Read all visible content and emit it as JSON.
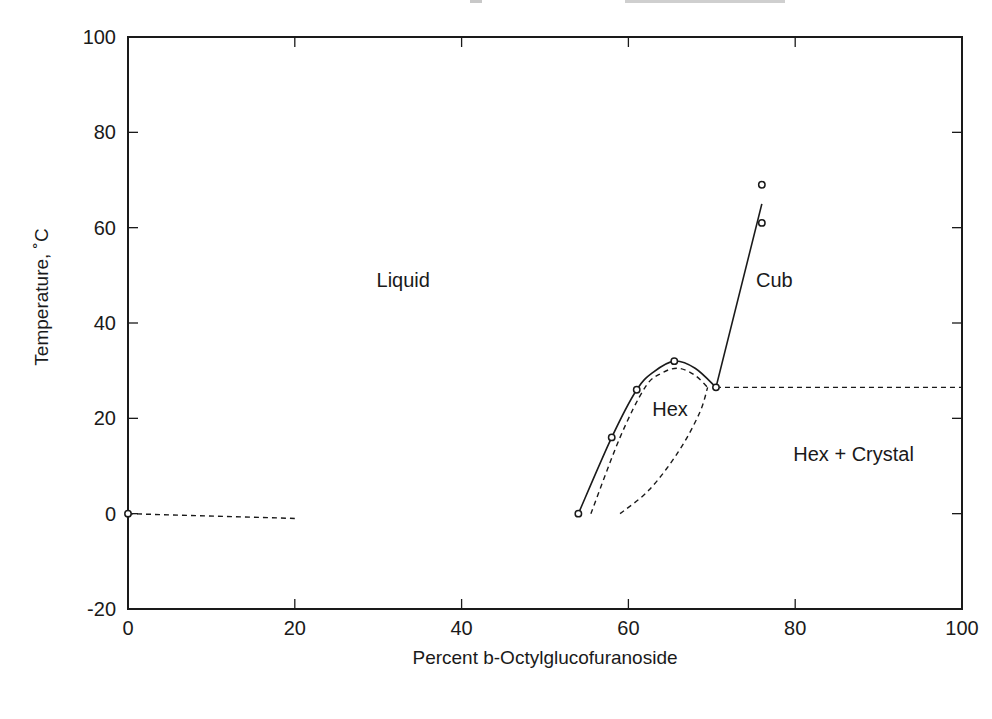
{
  "chart_data": {
    "type": "line",
    "title": "",
    "xlabel": "Percent b-Octylglucofuranoside",
    "ylabel": "Temperature, ˚C",
    "xlim": [
      0,
      100
    ],
    "ylim": [
      -20,
      100
    ],
    "xticks": [
      0,
      20,
      40,
      60,
      80,
      100
    ],
    "yticks": [
      -20,
      0,
      20,
      40,
      60,
      80,
      100
    ],
    "xtick_labels": [
      "0",
      "20",
      "40",
      "60",
      "80",
      "100"
    ],
    "ytick_labels": [
      "-20",
      "0",
      "20",
      "40",
      "60",
      "80",
      "100"
    ],
    "grid": false,
    "legend": null,
    "region_labels": [
      {
        "text": "Liquid",
        "x": 33,
        "y": 49
      },
      {
        "text": "Cub",
        "x": 77.5,
        "y": 49
      },
      {
        "text": "Hex",
        "x": 65,
        "y": 22
      },
      {
        "text": "Hex + Crystal",
        "x": 87,
        "y": 12.5
      }
    ],
    "markers": {
      "name": "Measured transition points",
      "style": "open-circle",
      "points": [
        {
          "x": 0,
          "y": 0
        },
        {
          "x": 54,
          "y": 0
        },
        {
          "x": 58,
          "y": 16
        },
        {
          "x": 61,
          "y": 26
        },
        {
          "x": 65.5,
          "y": 32
        },
        {
          "x": 70.5,
          "y": 26.5
        },
        {
          "x": 76,
          "y": 61
        },
        {
          "x": 76,
          "y": 69
        }
      ]
    },
    "series": [
      {
        "name": "Liquid / Hex boundary (solid)",
        "style": "solid",
        "points": [
          [
            54,
            0
          ],
          [
            58,
            16
          ],
          [
            61,
            26
          ],
          [
            63,
            29.7
          ],
          [
            65.5,
            32
          ],
          [
            68,
            30.5
          ],
          [
            70.5,
            26.5
          ]
        ]
      },
      {
        "name": "Hex / Cub boundary (solid)",
        "style": "solid",
        "points": [
          [
            70.5,
            26.5
          ],
          [
            76,
            65
          ]
        ]
      },
      {
        "name": "Ice melting line (dashed)",
        "style": "dashed",
        "points": [
          [
            0,
            0
          ],
          [
            20,
            -1
          ]
        ]
      },
      {
        "name": "Inner Hex boundary (dashed)",
        "style": "dashed",
        "points": [
          [
            55.5,
            0
          ],
          [
            59,
            16
          ],
          [
            62,
            26.5
          ],
          [
            64,
            29.5
          ],
          [
            66,
            30.5
          ],
          [
            68,
            29
          ],
          [
            69.5,
            26.5
          ]
        ]
      },
      {
        "name": "Hex / Crystal boundary (dashed)",
        "style": "dashed",
        "points": [
          [
            59,
            0
          ],
          [
            62.5,
            5
          ],
          [
            66,
            13
          ],
          [
            68.5,
            21
          ],
          [
            69.5,
            26.5
          ]
        ]
      },
      {
        "name": "Eutectic line (dashed)",
        "style": "dashed",
        "points": [
          [
            70.5,
            26.5
          ],
          [
            100,
            26.5
          ]
        ]
      }
    ]
  },
  "plot_area": {
    "left": 128,
    "right": 962,
    "top": 37,
    "bottom": 609
  }
}
